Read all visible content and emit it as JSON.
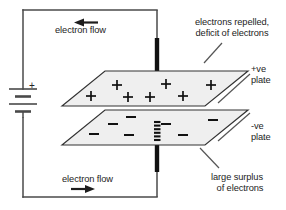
{
  "diagram": {
    "colors": {
      "wire": "#4a4a4a",
      "rod": "#111111",
      "plate_fill": "#efefef",
      "plate_stroke": "#333333",
      "text": "#232323",
      "charge": "#111111",
      "leader": "#555555",
      "background": "#ffffff"
    },
    "labels": {
      "electron_flow_top": "electron flow",
      "electron_flow_bottom": "electron flow",
      "electrons_repelled_line1": "electrons repelled,",
      "electrons_repelled_line2": "deficit of electrons",
      "positive_plate_line1": "+ve",
      "positive_plate_line2": "plate",
      "negative_plate_line1": "-ve",
      "negative_plate_line2": "plate",
      "surplus_line1": "large surplus",
      "surplus_line2": "of electrons",
      "battery_polarity": "+"
    },
    "battery": {
      "name": "battery",
      "cells": 2,
      "polarity_marker": "+"
    },
    "arrows": {
      "top": {
        "name": "electron-flow-arrow-top",
        "direction": "left"
      },
      "bottom": {
        "name": "electron-flow-arrow-bottom",
        "direction": "right"
      }
    },
    "top_plate": {
      "name": "positive-plate",
      "charge_symbol": "+",
      "charge_count": 7,
      "charges": [
        {
          "x": 91,
          "y": 96
        },
        {
          "x": 117,
          "y": 85
        },
        {
          "x": 128,
          "y": 97
        },
        {
          "x": 166,
          "y": 84
        },
        {
          "x": 183,
          "y": 96
        },
        {
          "x": 211,
          "y": 85
        }
      ]
    },
    "bottom_plate": {
      "name": "negative-plate",
      "charge_symbol": "−",
      "charge_count": 7,
      "charges": [
        {
          "x": 94,
          "y": 134
        },
        {
          "x": 113,
          "y": 124
        },
        {
          "x": 129,
          "y": 135
        },
        {
          "x": 131,
          "y": 117
        },
        {
          "x": 166,
          "y": 124
        },
        {
          "x": 183,
          "y": 135
        },
        {
          "x": 213,
          "y": 120
        }
      ]
    },
    "electron_stack": {
      "name": "electron-stack",
      "dots": 6
    }
  }
}
